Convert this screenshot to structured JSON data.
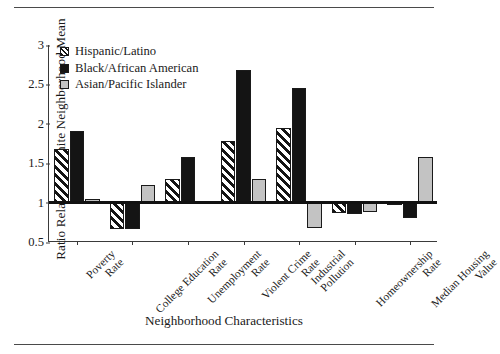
{
  "chart_data": {
    "type": "bar",
    "title": "",
    "xlabel": "Neighborhood Characteristics",
    "ylabel": "Ratio Relative to White Neighborhood Mean",
    "categories": [
      "Poverty Rate",
      "College Education Rate",
      "Unemployment Rate",
      "Violent Crime Rate",
      "Industrial Pollution",
      "Homeownership Rate",
      "Median Housing Value"
    ],
    "series": [
      {
        "name": "Hispanic/Latino",
        "values": [
          1.68,
          0.67,
          1.3,
          1.78,
          1.95,
          0.87,
          1.0
        ]
      },
      {
        "name": "Black/African American",
        "values": [
          1.91,
          0.67,
          1.58,
          2.68,
          2.45,
          0.85,
          0.8
        ]
      },
      {
        "name": "Asian/Pacific Islander",
        "values": [
          1.05,
          1.22,
          1.01,
          1.3,
          0.68,
          0.88,
          1.58
        ]
      }
    ],
    "ylim": [
      0.5,
      3
    ],
    "yticks": [
      "3",
      "2.5",
      "2",
      "1.5",
      "1",
      "0.5"
    ],
    "ytick_values": [
      3,
      2.5,
      2,
      1.5,
      1,
      0.5
    ],
    "baseline": 1,
    "grid": false,
    "legend_position": "top-left",
    "colors": {
      "hispanic_latino": "#ffffff",
      "black_african_american": "#141414",
      "asian_pacific_islander": "#c3c3c3",
      "axis": "#3a3a3a",
      "baseline": "#111111"
    }
  },
  "legend": {
    "items": [
      {
        "label": "Hispanic/Latino",
        "swatch": "hatched-swatch"
      },
      {
        "label": "Black/African American",
        "swatch": "black-swatch"
      },
      {
        "label": "Asian/Pacific Islander",
        "swatch": "gray-swatch"
      }
    ]
  },
  "x_labels": [
    {
      "line1": "Poverty",
      "line2": "Rate"
    },
    {
      "line1": "College Education",
      "line2": "Rate"
    },
    {
      "line1": "Unemployment",
      "line2": "Rate"
    },
    {
      "line1": "Violent Crime",
      "line2": "Rate"
    },
    {
      "line1": "Industrial",
      "line2": "Pollution"
    },
    {
      "line1": "Homeownership",
      "line2": "Rate"
    },
    {
      "line1": "Median Housing",
      "line2": "Value"
    }
  ]
}
